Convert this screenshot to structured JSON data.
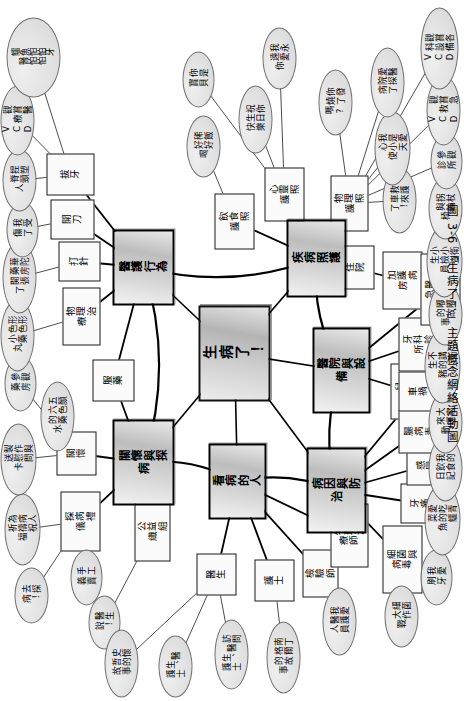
{
  "figure": {
    "caption": "圖 3-6 「生病了！」主題概念網絡活動圖",
    "center": "生病了！",
    "orientation": "rotated-90-ccw",
    "colors": {
      "node_fill": "#d6d6d6",
      "leaf_fill": "#e2e2e2",
      "line": "#000000",
      "page": "#ffffff"
    }
  },
  "branches": [
    {
      "id": "care-visit",
      "label": "關懷與探病",
      "subs": [
        {
          "label": "探病禮儀",
          "leaves": [
            "去探病！",
            "為病人祈禱祝福",
            "製作與送慰問卡"
          ]
        },
        {
          "label": "關懷",
          "leaves": [
            "手工義賣"
          ]
        },
        {
          "label": "公益組織",
          "leaves": []
        },
        {
          "label": "服藥",
          "leaves": [
            "五顏六色的藥水",
            "形形色色小藥丸",
            "參觀藥房",
            "華陀藥房開張了"
          ]
        }
      ]
    },
    {
      "id": "medical-behavior",
      "label": "醫護行為",
      "subs": [
        {
          "label": "物理治療",
          "leaves": [
            "我受傷了",
            "捏塑脊頸人"
          ]
        },
        {
          "label": "打針",
          "leaves": []
        },
        {
          "label": "開刀",
          "leaves": [
            "觀賞醫療 VCD"
          ]
        },
        {
          "label": "拔牙",
          "leaves": [
            "鱷魚怕怕牙醫怕怕"
          ]
        }
      ]
    },
    {
      "id": "disease-care",
      "label": "疾病照護",
      "subs": [
        {
          "label": "飲食照護",
          "leaves": [
            "稀飯好好喝",
            "你是寶貝"
          ]
        },
        {
          "label": "心靈照護",
          "leaves": [
            "祝你生日快樂",
            "我永遠愛你"
          ]
        },
        {
          "label": "物理照護",
          "leaves": [
            "你發燒了嗎?"
          ]
        },
        {
          "label": "住院",
          "leaves": [
            "救護車來了！",
            "我是愛心小天使"
          ]
        },
        {
          "label": "加護病房",
          "leaves": [
            "愛醫院探病了"
          ]
        }
      ]
    },
    {
      "id": "hospital-equipment",
      "label": "醫院與設備",
      "subs": [
        {
          "label": "兒科診所",
          "leaves": [
            "小小衛生檢查員",
            "拐杖與輪椅"
          ]
        },
        {
          "label": "牙科診所",
          "leaves": [
            "參觀診所"
          ]
        },
        {
          "label": "醫院與急診處",
          "leaves": [
            "觀賞急救 VCD",
            "觀賞各科設備 VCD"
          ]
        }
      ]
    },
    {
      "id": "cause-prevention",
      "label": "病因與防治",
      "subs": [
        {
          "label": "細菌與病毒",
          "leaves": [
            "細菌大作戰"
          ]
        },
        {
          "label": "牙痛",
          "leaves": [
            "我愛刷牙",
            "愛吃青菜的鱷魚"
          ]
        },
        {
          "label": "感冒",
          "leaves": [
            "我的飲食日記",
            "大家來運動"
          ]
        },
        {
          "label": "腸病毒",
          "leaves": [
            "不講衛生的小豬",
            "嘟嘟的故事"
          ]
        },
        {
          "label": "車禍",
          "leaves": []
        }
      ]
    },
    {
      "id": "patients",
      "label": "看病的人",
      "subs": [
        {
          "label": "醫生",
          "leaves": [
            "史懷哲的故事",
            "醫生說！"
          ]
        },
        {
          "label": "護士",
          "leaves": [
            "醫生、護士",
            "訪問醫生、護士",
            "南丁格爾的故事"
          ]
        },
        {
          "label": "檢驗師",
          "leaves": []
        },
        {
          "label": "物理治療師",
          "leaves": [
            "我愛醫護人員"
          ]
        }
      ]
    }
  ],
  "nodes": {
    "center": {
      "text": "生病了！",
      "x": 300,
      "y": 198,
      "w": 96,
      "h": 72
    },
    "b_care_visit": {
      "text": "關懷與探病",
      "x": 196,
      "y": 112,
      "w": 86,
      "h": 62
    },
    "b_medical": {
      "text": "醫護行為",
      "x": 396,
      "y": 112,
      "w": 76,
      "h": 62
    },
    "b_disease_care": {
      "text": "疾病照護",
      "x": 404,
      "y": 286,
      "w": 78,
      "h": 60
    },
    "b_hospital": {
      "text": "醫院與設備",
      "x": 288,
      "y": 312,
      "w": 86,
      "h": 58
    },
    "b_cause": {
      "text": "病因與防治",
      "x": 168,
      "y": 306,
      "w": 86,
      "h": 60
    },
    "b_patients": {
      "text": "看病的人",
      "x": 182,
      "y": 208,
      "w": 76,
      "h": 58
    },
    "s_visit_etiquette": {
      "text": "探病禮儀",
      "x": 150,
      "y": 60,
      "w": 60,
      "h": 40
    },
    "s_care": {
      "text": "關懷",
      "x": 226,
      "y": 56,
      "w": 44,
      "h": 40
    },
    "s_charity": {
      "text": "公益組織",
      "x": 140,
      "y": 134,
      "w": 60,
      "h": 36
    },
    "s_medicine": {
      "text": "服藥",
      "x": 300,
      "y": 92,
      "w": 42,
      "h": 42
    },
    "s_physio_treat": {
      "text": "物理治療",
      "x": 356,
      "y": 62,
      "w": 58,
      "h": 38
    },
    "s_injection": {
      "text": "打針",
      "x": 420,
      "y": 58,
      "w": 40,
      "h": 42
    },
    "s_surgery": {
      "text": "開刀",
      "x": 462,
      "y": 50,
      "w": 40,
      "h": 44
    },
    "s_tooth_pull": {
      "text": "拔牙",
      "x": 506,
      "y": 46,
      "w": 42,
      "h": 48
    },
    "s_diet_care": {
      "text": "飲食照護",
      "x": 452,
      "y": 214,
      "w": 56,
      "h": 40
    },
    "s_mind_care": {
      "text": "心靈照護",
      "x": 480,
      "y": 264,
      "w": 54,
      "h": 40
    },
    "s_physio_care": {
      "text": "物理照護",
      "x": 470,
      "y": 330,
      "w": 56,
      "h": 38
    },
    "s_inpatient": {
      "text": "住院",
      "x": 412,
      "y": 336,
      "w": 44,
      "h": 38
    },
    "s_icu": {
      "text": "加護病房",
      "x": 392,
      "y": 382,
      "w": 58,
      "h": 40
    },
    "s_peds": {
      "text": "兒科診所",
      "x": 282,
      "y": 390,
      "w": 56,
      "h": 40
    },
    "s_dental": {
      "text": "牙科診所",
      "x": 330,
      "y": 398,
      "w": 54,
      "h": 40
    },
    "s_emergency": {
      "text": "醫院與急診處",
      "x": 376,
      "y": 420,
      "w": 72,
      "h": 40
    },
    "s_bacteria": {
      "text": "細菌與病毒",
      "x": 108,
      "y": 382,
      "w": 68,
      "h": 40
    },
    "s_toothache": {
      "text": "牙痛",
      "x": 178,
      "y": 400,
      "w": 40,
      "h": 40
    },
    "s_cold": {
      "text": "感冒",
      "x": 216,
      "y": 406,
      "w": 40,
      "h": 40
    },
    "s_entero": {
      "text": "腸病毒",
      "x": 248,
      "y": 398,
      "w": 44,
      "h": 42
    },
    "s_accident": {
      "text": "車禍",
      "x": 290,
      "y": 398,
      "w": 40,
      "h": 40
    },
    "s_doctor": {
      "text": "醫生",
      "x": 106,
      "y": 196,
      "w": 42,
      "h": 40
    },
    "s_nurse": {
      "text": "護士",
      "x": 100,
      "y": 254,
      "w": 42,
      "h": 40
    },
    "s_lab": {
      "text": "檢驗師",
      "x": 104,
      "y": 302,
      "w": 48,
      "h": 36
    },
    "s_physio_th": {
      "text": "物理治療師",
      "x": 134,
      "y": 330,
      "w": 64,
      "h": 38
    }
  },
  "leaves": [
    {
      "text": "去探病！",
      "x": 78,
      "y": 14,
      "w": 56,
      "h": 34
    },
    {
      "text": "為病人祈禱祝福",
      "x": 136,
      "y": 4,
      "w": 72,
      "h": 36
    },
    {
      "text": "製作與送慰問卡",
      "x": 206,
      "y": 0,
      "w": 72,
      "h": 36
    },
    {
      "text": "五顏六色的藥水",
      "x": 250,
      "y": 40,
      "w": 70,
      "h": 34
    },
    {
      "text": "參觀藥房",
      "x": 290,
      "y": 4,
      "w": 56,
      "h": 32
    },
    {
      "text": "形形色色小藥丸",
      "x": 330,
      "y": 0,
      "w": 72,
      "h": 34
    },
    {
      "text": "華陀藥房開張了",
      "x": 388,
      "y": 2,
      "w": 72,
      "h": 34
    },
    {
      "text": "我受傷了",
      "x": 444,
      "y": 6,
      "w": 56,
      "h": 32
    },
    {
      "text": "捏塑脊頸人",
      "x": 490,
      "y": 2,
      "w": 62,
      "h": 34
    },
    {
      "text": "觀賞醫療 VCD",
      "x": 546,
      "y": 0,
      "w": 70,
      "h": 34
    },
    {
      "text": "鱷魚怕怕牙醫怕怕",
      "x": 604,
      "y": 6,
      "w": 80,
      "h": 54
    },
    {
      "text": "手工義賣",
      "x": 96,
      "y": 70,
      "w": 56,
      "h": 32
    },
    {
      "text": "醫生說！",
      "x": 52,
      "y": 88,
      "w": 54,
      "h": 32
    },
    {
      "text": "史懷哲的故事",
      "x": 4,
      "y": 104,
      "w": 68,
      "h": 34
    },
    {
      "text": "醫生、護士",
      "x": 4,
      "y": 158,
      "w": 62,
      "h": 34
    },
    {
      "text": "訪問醫生、護士",
      "x": 12,
      "y": 214,
      "w": 70,
      "h": 34
    },
    {
      "text": "南丁格爾的故事",
      "x": 8,
      "y": 266,
      "w": 72,
      "h": 34
    },
    {
      "text": "我愛醫護人員",
      "x": 46,
      "y": 322,
      "w": 68,
      "h": 34
    },
    {
      "text": "細菌大作戰",
      "x": 54,
      "y": 384,
      "w": 62,
      "h": 34
    },
    {
      "text": "我愛刷牙",
      "x": 96,
      "y": 420,
      "w": 56,
      "h": 32
    },
    {
      "text": "愛吃青菜的鱷魚",
      "x": 146,
      "y": 424,
      "w": 72,
      "h": 36
    },
    {
      "text": "我的飲食日記",
      "x": 200,
      "y": 428,
      "w": 66,
      "h": 34
    },
    {
      "text": "大家來運動",
      "x": 248,
      "y": 428,
      "w": 62,
      "h": 34
    },
    {
      "text": "不講衛生的小豬",
      "x": 298,
      "y": 424,
      "w": 74,
      "h": 36
    },
    {
      "text": "嘟嘟的故事",
      "x": 356,
      "y": 428,
      "w": 62,
      "h": 34
    },
    {
      "text": "小小衛生檢查員",
      "x": 404,
      "y": 426,
      "w": 72,
      "h": 36
    },
    {
      "text": "拐杖與輪椅",
      "x": 462,
      "y": 428,
      "w": 62,
      "h": 34
    },
    {
      "text": "參觀診所",
      "x": 512,
      "y": 430,
      "w": 56,
      "h": 32
    },
    {
      "text": "觀賞急救 VCD",
      "x": 556,
      "y": 426,
      "w": 70,
      "h": 34
    },
    {
      "text": "觀賞各科設備 VCD",
      "x": 612,
      "y": 420,
      "w": 82,
      "h": 38
    },
    {
      "text": "稀飯好好喝",
      "x": 524,
      "y": 186,
      "w": 62,
      "h": 34
    },
    {
      "text": "你是寶貝",
      "x": 594,
      "y": 182,
      "w": 56,
      "h": 32
    },
    {
      "text": "祝你生日快樂",
      "x": 548,
      "y": 238,
      "w": 68,
      "h": 34
    },
    {
      "text": "我永遠愛你",
      "x": 612,
      "y": 262,
      "w": 62,
      "h": 34
    },
    {
      "text": "你發燒了嗎?",
      "x": 566,
      "y": 318,
      "w": 66,
      "h": 34
    },
    {
      "text": "救護車來了！",
      "x": 468,
      "y": 382,
      "w": 66,
      "h": 34
    },
    {
      "text": "我是愛心小天使",
      "x": 516,
      "y": 374,
      "w": 74,
      "h": 36
    },
    {
      "text": "愛醫院探病了",
      "x": 584,
      "y": 370,
      "w": 70,
      "h": 34
    }
  ],
  "links_main": [
    [
      "center",
      "b_care_visit"
    ],
    [
      "center",
      "b_medical"
    ],
    [
      "center",
      "b_disease_care"
    ],
    [
      "center",
      "b_hospital"
    ],
    [
      "center",
      "b_cause"
    ],
    [
      "center",
      "b_patients"
    ],
    [
      "b_care_visit",
      "b_medical"
    ],
    [
      "b_medical",
      "b_disease_care"
    ],
    [
      "b_disease_care",
      "b_hospital"
    ],
    [
      "b_hospital",
      "b_cause"
    ],
    [
      "b_cause",
      "b_patients"
    ],
    [
      "b_patients",
      "b_care_visit"
    ]
  ]
}
